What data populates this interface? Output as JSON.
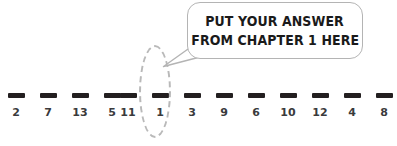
{
  "worksheet": {
    "title": "Number blanks worksheet with answer callout",
    "colors": {
      "dash": "#231f20",
      "label": "#3a3a3c",
      "ellipse": "#b9b9b9",
      "bubble_border": "#b4b4b4",
      "bubble_fill": "#ffffff",
      "bubble_text": "#1a1a1a",
      "background": "#ffffff"
    },
    "blank_groups": [
      {
        "name": "left-group",
        "slots": [
          {
            "label": "2"
          },
          {
            "label": "7"
          },
          {
            "label": "13"
          },
          {
            "label": "5"
          }
        ]
      },
      {
        "name": "middle-group",
        "slots": [
          {
            "label": "11"
          },
          {
            "label": "1"
          },
          {
            "label": "3"
          },
          {
            "label": "9"
          }
        ]
      },
      {
        "name": "right-group",
        "slots": [
          {
            "label": "6"
          },
          {
            "label": "10"
          },
          {
            "label": "12"
          },
          {
            "label": "4"
          },
          {
            "label": "8"
          }
        ]
      }
    ],
    "highlight": {
      "name": "dashed-ellipse",
      "target_label": "1",
      "style": "dashed"
    },
    "callout": {
      "line1": "PUT YOUR ANSWER",
      "line2": "FROM CHAPTER 1 HERE",
      "tail_direction": "down-left"
    }
  }
}
